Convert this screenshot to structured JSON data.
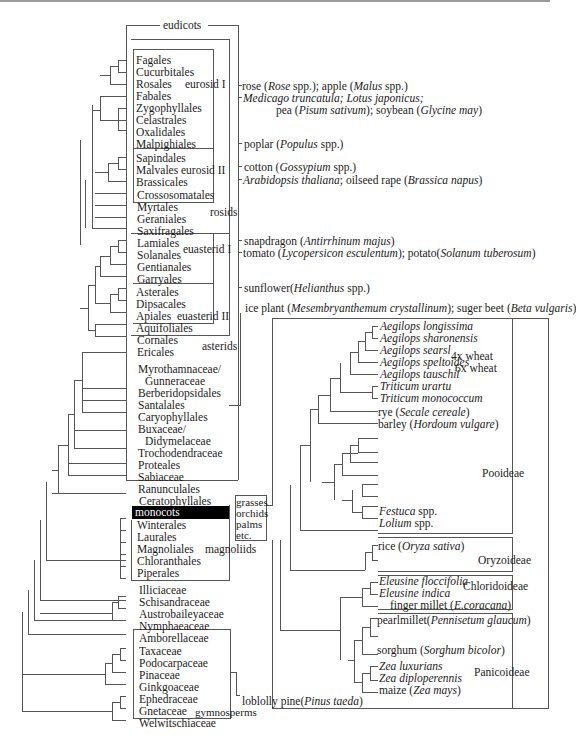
{
  "figure": {
    "type": "phylogenetic-tree"
  },
  "clades": {
    "eudicots": "eudicots",
    "eurosid1": "eurosid I",
    "eurosid2": "eurosid II",
    "rosids": "rosids",
    "euasterid1": "euasterid I",
    "euasterid2": "euasterid II",
    "asterids": "asterids",
    "monocots": "monocots",
    "magnoliids": "magnoliids",
    "gymnosperms": "gymnosperms",
    "monocot_examples": [
      "grasses",
      "orchids",
      "palms",
      "etc."
    ],
    "pooideae": "Pooideae",
    "oryzoideae": "Oryzoideae",
    "chloridoideae": "Chloridoideae",
    "panicoideae": "Panicoideae",
    "wheat4x": "4x wheat",
    "wheat6x": "6x wheat"
  },
  "taxa": {
    "eurosid1": [
      "Fagales",
      "Cucurbitales",
      "Rosales",
      "Fabales",
      "Zygophyllales",
      "Celastrales",
      "Oxalidales",
      "Malpighiales"
    ],
    "eurosid2": [
      "Sapindales",
      "Malvales",
      "Brassicales"
    ],
    "rosids_other": [
      "Crossosomatales",
      "Myrtales",
      "Geraniales",
      "Saxifragales"
    ],
    "euasterid1": [
      "Lamiales",
      "Solanales",
      "Gentianales",
      "Garryales"
    ],
    "euasterid2": [
      "Asterales",
      "Dipsacales",
      "Apiales",
      "Aquifoliales"
    ],
    "asterids_other": [
      "Cornales",
      "Ericales"
    ],
    "core_eudicots": [
      "Myrothamnaceae/",
      "Gunneraceae",
      "Berberidopsidales",
      "Santalales",
      "Caryophyllales",
      "Buxaceae/",
      "Didymelaceae",
      "Trochodendraceae",
      "Proteales",
      "Sabiaceae",
      "Ranunculales"
    ],
    "ceratophyllales": "Ceratophyllales",
    "magnoliids": [
      "Winterales",
      "Laurales",
      "Magnoliales",
      "Chloranthales",
      "Piperales"
    ],
    "basal": [
      "Illiciaceae",
      "Schisandraceae",
      "Austrobaileyaceae",
      "Nymphaeaceae",
      "Amborellaceae"
    ],
    "gymnosperms": [
      "Taxaceae",
      "Podocarpaceae",
      "Pinaceae",
      "Ginkgoaceae",
      "Ephedraceae",
      "Gnetaceae",
      "Welwitschiaceae"
    ]
  },
  "species_notes": {
    "rose": [
      "rose (",
      "Rose",
      " spp.); apple (",
      "Malus",
      " spp.)"
    ],
    "medicago_line1": "Medicago truncatula; Lotus japonicus;",
    "medicago_line2": [
      "pea (",
      "Pisum sativum",
      "); soybean (",
      "Glycine may",
      ")"
    ],
    "poplar": [
      "poplar (",
      "Populus",
      " spp.)"
    ],
    "cotton": [
      "cotton (",
      "Gossypium",
      " spp.)"
    ],
    "arabidopsis": [
      "Arabidopsis thaliana",
      "; oilseed rape (",
      "Brassica napus",
      ")"
    ],
    "snapdragon": [
      "snapdragon (",
      "Antirrhinum majus",
      ")"
    ],
    "tomato": [
      "tomato (",
      "Lycopersicon esculentum",
      "); potato(",
      "Solanum tuberosum",
      ")"
    ],
    "sunflower": [
      "sunflower(",
      "Helianthus",
      " spp.)"
    ],
    "iceplant": [
      "ice plant (",
      "Mesembryanthemum crystallinum",
      "); suger beet (",
      "Beta vulgaris",
      ")"
    ],
    "pine": [
      "loblolly pine(",
      "Pinus taeda",
      ")"
    ]
  },
  "grasses": {
    "pooideae": [
      "Aegilops longissima",
      "Aegilops sharonensis",
      "Aegilops searsl",
      "Aegilops speltoides",
      "Aegilops tauschii",
      "Triticum urartu",
      "Triticum monococcum"
    ],
    "rye": [
      "rye (",
      "Secale cereale",
      ")"
    ],
    "barley": [
      "barley (",
      "Hordoum vulgare",
      ")"
    ],
    "festuca": [
      "Festuca",
      " spp."
    ],
    "lolium": [
      "Lolium",
      " spp."
    ],
    "rice": [
      "rice (",
      "Oryza sativa",
      ")"
    ],
    "eleusine1": "Eleusine floccifolia",
    "eleusine2": "Eleusine indica",
    "finger_millet": [
      "finger millet (",
      "E.coracana",
      ")"
    ],
    "pearl_millet": [
      "pearlmillet(",
      "Pennisetum glaucum",
      ")"
    ],
    "sorghum": [
      "sorghum (",
      "Sorghum bicolor",
      ")"
    ],
    "zea1": "Zea luxurians",
    "zea2": "Zea diploperennis",
    "maize": [
      "maize (",
      "Zea mays",
      ")"
    ]
  },
  "colors": {
    "line": "#555555",
    "text": "#1a1a1a",
    "highlight": "#000000"
  }
}
